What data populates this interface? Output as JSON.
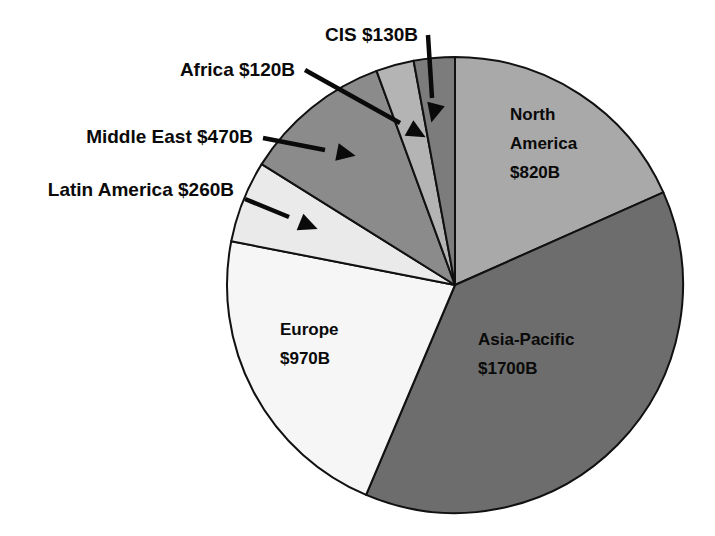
{
  "chart_data": {
    "type": "pie",
    "title": "",
    "subtitle": "",
    "xlabel": "",
    "ylabel": "",
    "units": "USD billions",
    "total": 4470,
    "legend_position": "none",
    "grid": false,
    "categories": [
      "North America",
      "Asia-Pacific",
      "Europe",
      "Latin America",
      "Middle East",
      "Africa",
      "CIS"
    ],
    "values": [
      820,
      1700,
      970,
      260,
      470,
      120,
      130
    ],
    "labels": [
      "North America $820B",
      "Asia-Pacific $1700B",
      "Europe $970B",
      "Latin America $260B",
      "Middle East $470B",
      "Africa $120B",
      "CIS $130B"
    ],
    "colors": [
      "#a9a9a9",
      "#6d6d6d",
      "#f6f6f6",
      "#eaeaea",
      "#8b8b8b",
      "#b4b4b4",
      "#7c7c7c"
    ]
  },
  "slices": [
    {
      "name": "North America",
      "value_label": "$820B",
      "line1": "North",
      "line2": "America",
      "line3": "$820B",
      "color": "#a9a9a9",
      "start_angle": 0,
      "end_angle": 66.04,
      "label_x": 510,
      "label_y": 120,
      "label_placement": "inside"
    },
    {
      "name": "Asia-Pacific",
      "value_label": "$1700B",
      "line1": "Asia-Pacific",
      "line2": "$1700B",
      "line3": "",
      "color": "#6d6d6d",
      "start_angle": 66.04,
      "end_angle": 202.95,
      "label_x": 478,
      "label_y": 345,
      "label_placement": "inside"
    },
    {
      "name": "Europe",
      "value_label": "$970B",
      "line1": "Europe",
      "line2": "$970B",
      "line3": "",
      "color": "#f6f6f6",
      "start_angle": 202.95,
      "end_angle": 281.07,
      "label_x": 280,
      "label_y": 335,
      "label_placement": "inside"
    },
    {
      "name": "Latin America",
      "value_label": "$260B",
      "line1": "",
      "line2": "",
      "line3": "",
      "color": "#eaeaea",
      "start_angle": 281.07,
      "end_angle": 302.01,
      "label_placement": "callout"
    },
    {
      "name": "Middle East",
      "value_label": "$470B",
      "line1": "",
      "line2": "",
      "line3": "",
      "color": "#8b8b8b",
      "start_angle": 302.01,
      "end_angle": 339.87,
      "label_placement": "callout"
    },
    {
      "name": "Africa",
      "value_label": "$120B",
      "line1": "",
      "line2": "",
      "line3": "",
      "color": "#b4b4b4",
      "start_angle": 339.87,
      "end_angle": 349.54,
      "label_placement": "callout"
    },
    {
      "name": "CIS",
      "value_label": "$130B",
      "line1": "",
      "line2": "",
      "line3": "",
      "color": "#7c7c7c",
      "start_angle": 349.54,
      "end_angle": 360,
      "label_placement": "callout"
    }
  ],
  "callouts": [
    {
      "key": "cis",
      "text": "CIS $130B",
      "text_x": 418,
      "text_y": 41,
      "anchor": "end",
      "line_x1": 428,
      "line_y1": 35,
      "line_x2": 432,
      "line_y2": 98,
      "arrow_cx": 436,
      "arrow_cy": 104,
      "arrow_rot": 104
    },
    {
      "key": "africa",
      "text": "Africa $120B",
      "text_x": 295,
      "text_y": 76,
      "anchor": "end",
      "line_x1": 305,
      "line_y1": 70,
      "line_x2": 400,
      "line_y2": 123,
      "arrow_cx": 409,
      "arrow_cy": 128,
      "arrow_rot": 29
    },
    {
      "key": "middle-east",
      "text": "Middle East $470B",
      "text_x": 253,
      "text_y": 143,
      "anchor": "end",
      "line_x1": 263,
      "line_y1": 138,
      "line_x2": 325,
      "line_y2": 150,
      "arrow_cx": 337,
      "arrow_cy": 152,
      "arrow_rot": 11
    },
    {
      "key": "latin-america",
      "text": "Latin America $260B",
      "text_x": 234,
      "text_y": 196,
      "anchor": "end",
      "line_x1": 245,
      "line_y1": 199,
      "line_x2": 289,
      "line_y2": 217,
      "arrow_cx": 300,
      "arrow_cy": 222,
      "arrow_rot": 22
    }
  ],
  "geometry": {
    "center_x": 455,
    "center_y": 285,
    "radius": 228
  }
}
